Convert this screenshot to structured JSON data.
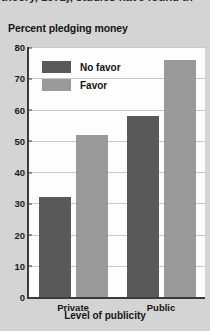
{
  "page": {
    "clipped_body_text": "theory, 1972), studies have found th",
    "background_color": "#d4d4d4"
  },
  "chart_data": {
    "type": "bar",
    "title": "Percent pledging money",
    "xlabel": "Level of publicity",
    "ylabel": "",
    "categories": [
      "Private",
      "Public"
    ],
    "series": [
      {
        "name": "No favor",
        "values": [
          32,
          58
        ],
        "color": "#595959"
      },
      {
        "name": "Favor",
        "values": [
          52,
          76
        ],
        "color": "#9a9a9a"
      }
    ],
    "ylim": [
      0,
      80
    ],
    "yticks": [
      0,
      10,
      20,
      30,
      40,
      50,
      60,
      70,
      80
    ],
    "ytick_labels": [
      "0",
      "10",
      "20",
      "30",
      "40",
      "50",
      "60",
      "70",
      "80"
    ],
    "grid": true,
    "legend_position": "top-left-inside",
    "legend_entries": [
      "No favor",
      "Favor"
    ]
  }
}
